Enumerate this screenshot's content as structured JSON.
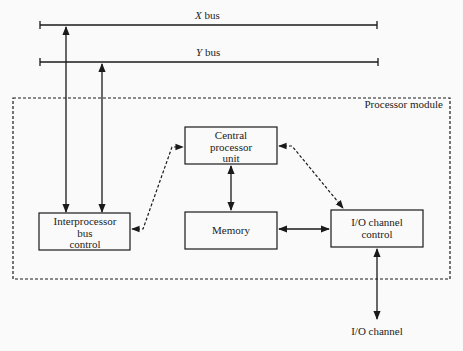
{
  "buses": {
    "x_bus": {
      "label_italic": "X",
      "label_rest": " bus"
    },
    "y_bus": {
      "label_italic": "Y",
      "label_rest": " bus"
    }
  },
  "module": {
    "label": "Processor module"
  },
  "blocks": {
    "cpu": {
      "lines": [
        "Central",
        "processor",
        "unit"
      ]
    },
    "ipbc": {
      "lines": [
        "Interprocessor",
        "bus",
        "control"
      ]
    },
    "memory": {
      "lines": [
        "Memory"
      ]
    },
    "ioc": {
      "lines": [
        "I/O channel",
        "control"
      ]
    }
  },
  "io_channel": {
    "label": "I/O channel"
  },
  "caption_fragment": {
    "text": "...(c) ... of T... Compu..."
  },
  "colors": {
    "ink": "#1a1a1a",
    "background": "#fafafa"
  }
}
